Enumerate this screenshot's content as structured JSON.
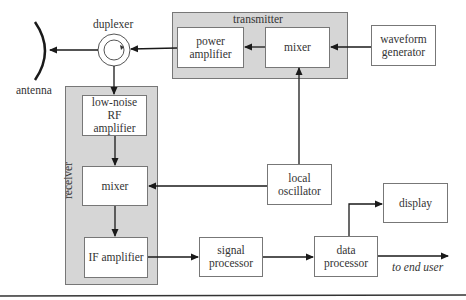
{
  "groups": {
    "transmitter": "transmitter",
    "receiver": "receiver"
  },
  "blocks": {
    "power_amplifier": [
      "power",
      "amplifier"
    ],
    "tx_mixer": "mixer",
    "waveform_generator": [
      "waveform",
      "generator"
    ],
    "lna": [
      "low-noise",
      "RF",
      "amplifier"
    ],
    "rx_mixer": "mixer",
    "if_amplifier": "IF amplifier",
    "local_oscillator": [
      "local",
      "oscillator"
    ],
    "signal_processor": [
      "signal",
      "processor"
    ],
    "data_processor": [
      "data",
      "processor"
    ],
    "display": "display"
  },
  "labels": {
    "duplexer": "duplexer",
    "antenna": "antenna",
    "to_end_user": "to end user"
  },
  "icons": {
    "antenna": "antenna-dish-arc-icon",
    "duplexer": "circulator-icon"
  },
  "colors": {
    "group_fill": "#d6d6d6",
    "stroke": "#222222",
    "box_border": "#777777"
  }
}
